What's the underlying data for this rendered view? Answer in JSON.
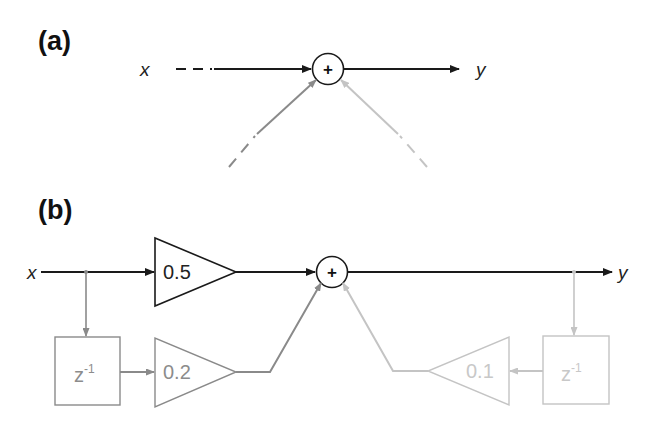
{
  "panels": {
    "a": {
      "label": "(a)",
      "input": "x",
      "output": "y",
      "sum_symbol": "+"
    },
    "b": {
      "label": "(b)",
      "input": "x",
      "output": "y",
      "sum_symbol": "+",
      "feedforward_gain": "0.5",
      "delayed_input_gain": "0.2",
      "feedback_gain": "0.1",
      "delay_left": {
        "base": "z",
        "exp": "-1"
      },
      "delay_right": {
        "base": "z",
        "exp": "-1"
      }
    }
  },
  "colors": {
    "black": "#1a1a1a",
    "mid_gray": "#8a8a8a",
    "light_gray": "#c4c4c4",
    "text_dark": "#222222",
    "text_mid": "#8c8c8c",
    "text_light": "#c8c8c8"
  }
}
